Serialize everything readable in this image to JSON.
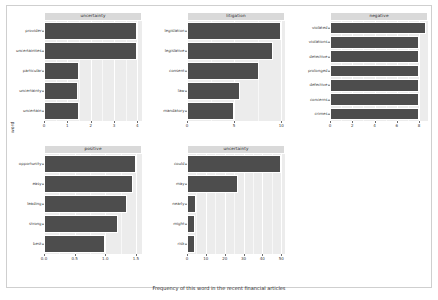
{
  "figure": {
    "xlabel": "Frequency of this word in the recent financial articles",
    "ylabel": "word",
    "bar_color": "#4d4d4d",
    "panel_bg": "#ececec",
    "strip_bg": "#d9d9d9",
    "grid_color": "#ffffff"
  },
  "chart_data": {
    "type": "bar",
    "orientation": "horizontal",
    "title": "",
    "xlabel": "Frequency of this word in the recent financial articles",
    "ylabel": "word",
    "grid": true,
    "legend": "none",
    "facet_layout": "2 rows x 3 columns (5 panels, top-right cell empty)",
    "panels": [
      {
        "name": "uncertainty",
        "categories": [
          "provider",
          "uncertainties",
          "particular",
          "uncertainty",
          "uncertain"
        ],
        "values": [
          4.0,
          4.0,
          1.5,
          1.45,
          1.5
        ],
        "xlim": [
          0,
          4.2
        ],
        "xticks": [
          0,
          1,
          2,
          3,
          4
        ],
        "xticklabels": [
          "0",
          "1",
          "2",
          "3",
          "4"
        ]
      },
      {
        "name": "litigation",
        "categories": [
          "legislation",
          "legislative",
          "consent",
          "law",
          "mandatory"
        ],
        "values": [
          10.0,
          9.1,
          7.6,
          5.6,
          5.0
        ],
        "xlim": [
          0,
          10.4
        ],
        "xticks": [
          0,
          5,
          10
        ],
        "xticklabels": [
          "0",
          "5",
          "10"
        ]
      },
      {
        "name": "negative",
        "categories": [
          "violated",
          "violations",
          "detective",
          "prolonged",
          "defective",
          "concerns",
          "crimes"
        ],
        "values": [
          8.6,
          8.0,
          8.0,
          8.0,
          8.0,
          8.0,
          8.0
        ],
        "xlim": [
          0,
          8.8
        ],
        "xticks": [
          0,
          2,
          4,
          6,
          8
        ],
        "xticklabels": [
          "0",
          "2",
          "4",
          "6",
          "8"
        ]
      },
      {
        "name": "positive",
        "categories": [
          "opportunity",
          "easy",
          "leading",
          "strong",
          "best"
        ],
        "values": [
          1.5,
          1.45,
          1.35,
          1.2,
          1.0
        ],
        "xlim": [
          0,
          1.6
        ],
        "xticks": [
          0.0,
          0.5,
          1.0,
          1.5
        ],
        "xticklabels": [
          "0.0",
          "0.5",
          "1.0",
          "1.5"
        ]
      },
      {
        "name": "uncertainty",
        "categories": [
          "could",
          "may",
          "nearly",
          "might",
          "risk"
        ],
        "values": [
          50.0,
          27.0,
          5.0,
          4.5,
          4.0
        ],
        "xlim": [
          0,
          52
        ],
        "xticks": [
          0,
          10,
          20,
          30,
          40,
          50
        ],
        "xticklabels": [
          "0",
          "10",
          "20",
          "30",
          "40",
          "50"
        ]
      }
    ]
  }
}
